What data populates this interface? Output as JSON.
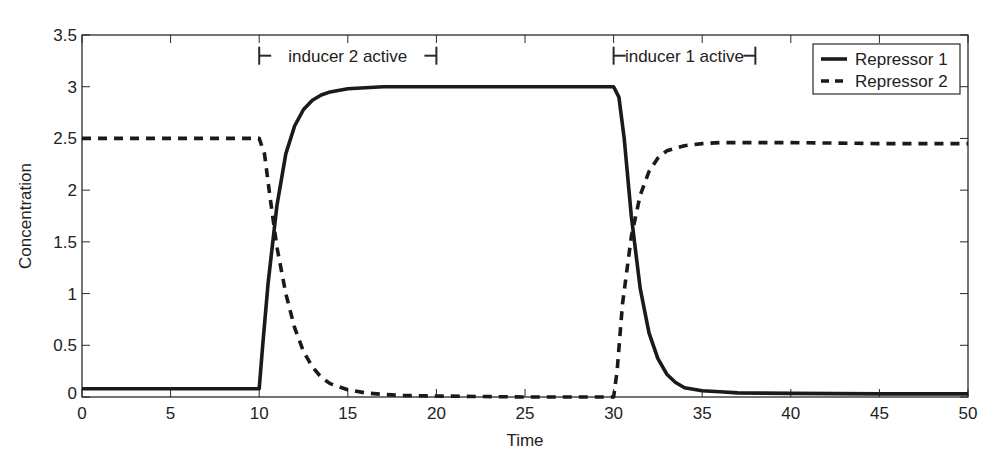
{
  "chart_data": {
    "type": "line",
    "title": "",
    "xlabel": "Time",
    "ylabel": "Concentration",
    "xlim": [
      0,
      50
    ],
    "ylim": [
      0,
      3.5
    ],
    "xticks": [
      0,
      5,
      10,
      15,
      20,
      25,
      30,
      35,
      40,
      45,
      50
    ],
    "xtick_labels": [
      "0",
      "5",
      "10",
      "15",
      "20",
      "25",
      "30",
      "35",
      "40",
      "45",
      "50"
    ],
    "yticks": [
      0,
      0.5,
      1,
      1.5,
      2,
      2.5,
      3,
      3.5
    ],
    "ytick_labels": [
      "0",
      "0.5",
      "1",
      "1.5",
      "2",
      "2.5",
      "3",
      "3.5"
    ],
    "grid": false,
    "legend_position": "upper right",
    "series": [
      {
        "name": "Repressor 1",
        "style": "solid",
        "color": "#1a1a1a",
        "x": [
          0,
          5,
          10,
          10.2,
          10.5,
          11,
          11.5,
          12,
          12.5,
          13,
          13.5,
          14,
          15,
          16,
          17,
          18,
          20,
          25,
          30,
          30.3,
          30.6,
          31,
          31.5,
          32,
          32.5,
          33,
          33.5,
          34,
          35,
          36,
          37,
          40,
          45,
          50
        ],
        "y": [
          0.08,
          0.08,
          0.08,
          0.5,
          1.1,
          1.85,
          2.35,
          2.62,
          2.78,
          2.87,
          2.92,
          2.95,
          2.98,
          2.99,
          3.0,
          3.0,
          3.0,
          3.0,
          3.0,
          2.9,
          2.5,
          1.75,
          1.05,
          0.62,
          0.37,
          0.22,
          0.14,
          0.09,
          0.06,
          0.05,
          0.04,
          0.035,
          0.03,
          0.03
        ]
      },
      {
        "name": "Repressor 2",
        "style": "dashed",
        "color": "#1a1a1a",
        "x": [
          0,
          5,
          10,
          10.3,
          10.6,
          11,
          11.5,
          12,
          12.5,
          13,
          13.5,
          14,
          15,
          16,
          17,
          18,
          20,
          25,
          30,
          30.2,
          30.5,
          31,
          31.5,
          32,
          32.5,
          33,
          34,
          35,
          36,
          38,
          40,
          45,
          50
        ],
        "y": [
          2.5,
          2.5,
          2.5,
          2.35,
          1.95,
          1.45,
          1.0,
          0.67,
          0.44,
          0.29,
          0.19,
          0.13,
          0.07,
          0.04,
          0.025,
          0.015,
          0.01,
          0.0,
          0.0,
          0.25,
          0.9,
          1.55,
          1.95,
          2.18,
          2.31,
          2.38,
          2.43,
          2.45,
          2.46,
          2.46,
          2.46,
          2.45,
          2.45
        ]
      }
    ],
    "annotations": [
      {
        "text": "inducer 2 active",
        "x_start": 10,
        "x_end": 20,
        "y": 3.3
      },
      {
        "text": "inducer 1 active",
        "x_start": 30,
        "x_end": 38,
        "y": 3.3
      }
    ]
  },
  "layout": {
    "plot_left": 82,
    "plot_right": 968,
    "plot_top": 35,
    "plot_bottom": 397
  }
}
